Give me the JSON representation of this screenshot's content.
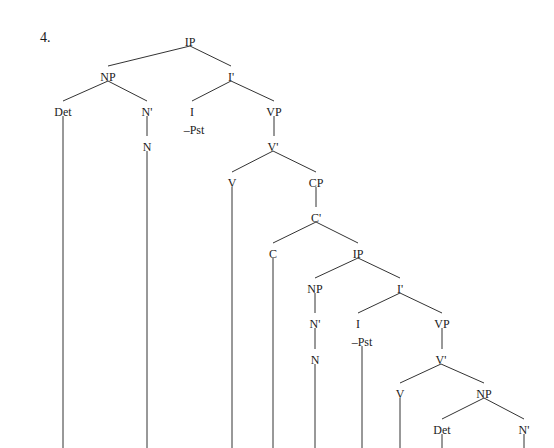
{
  "example_number": "4.",
  "tree": {
    "nodes": [
      {
        "id": "ip1",
        "label": "IP",
        "x": 190,
        "y": 42
      },
      {
        "id": "np1",
        "label": "NP",
        "x": 108,
        "y": 77
      },
      {
        "id": "ibar1",
        "label": "I'",
        "x": 231,
        "y": 77
      },
      {
        "id": "det1",
        "label": "Det",
        "x": 63,
        "y": 112
      },
      {
        "id": "nbar1",
        "label": "N'",
        "x": 147,
        "y": 112
      },
      {
        "id": "i1",
        "label": "I",
        "x": 192,
        "y": 112
      },
      {
        "id": "i1f",
        "label": "–Pst",
        "x": 194,
        "y": 130
      },
      {
        "id": "vp1",
        "label": "VP",
        "x": 274,
        "y": 112
      },
      {
        "id": "n1",
        "label": "N",
        "x": 147,
        "y": 147
      },
      {
        "id": "vbar1",
        "label": "V'",
        "x": 273,
        "y": 147
      },
      {
        "id": "v1",
        "label": "V",
        "x": 232,
        "y": 183
      },
      {
        "id": "cp1",
        "label": "CP",
        "x": 316,
        "y": 183
      },
      {
        "id": "cbar1",
        "label": "C'",
        "x": 316,
        "y": 218
      },
      {
        "id": "c1",
        "label": "C",
        "x": 273,
        "y": 254
      },
      {
        "id": "ip2",
        "label": "IP",
        "x": 358,
        "y": 254
      },
      {
        "id": "np2",
        "label": "NP",
        "x": 315,
        "y": 289
      },
      {
        "id": "ibar2",
        "label": "I'",
        "x": 400,
        "y": 289
      },
      {
        "id": "nbar2",
        "label": "N'",
        "x": 315,
        "y": 324
      },
      {
        "id": "i2",
        "label": "I",
        "x": 358,
        "y": 324
      },
      {
        "id": "i2f",
        "label": "–Pst",
        "x": 362,
        "y": 342
      },
      {
        "id": "vp2",
        "label": "VP",
        "x": 442,
        "y": 324
      },
      {
        "id": "n2",
        "label": "N",
        "x": 315,
        "y": 360
      },
      {
        "id": "vbar2",
        "label": "V'",
        "x": 441,
        "y": 360
      },
      {
        "id": "v2",
        "label": "V",
        "x": 400,
        "y": 394
      },
      {
        "id": "np3",
        "label": "NP",
        "x": 484,
        "y": 394
      },
      {
        "id": "det2",
        "label": "Det",
        "x": 442,
        "y": 430
      },
      {
        "id": "nbar3",
        "label": "N'",
        "x": 524,
        "y": 430
      }
    ],
    "edges": [
      [
        190,
        46,
        108,
        66
      ],
      [
        190,
        46,
        231,
        66
      ],
      [
        108,
        81,
        63,
        101
      ],
      [
        108,
        81,
        147,
        101
      ],
      [
        231,
        81,
        192,
        101
      ],
      [
        231,
        81,
        274,
        101
      ],
      [
        147,
        116,
        147,
        136
      ],
      [
        274,
        116,
        274,
        136
      ],
      [
        273,
        151,
        232,
        172
      ],
      [
        273,
        151,
        316,
        172
      ],
      [
        316,
        187,
        316,
        207
      ],
      [
        316,
        222,
        273,
        243
      ],
      [
        316,
        222,
        358,
        243
      ],
      [
        358,
        258,
        315,
        278
      ],
      [
        358,
        258,
        400,
        278
      ],
      [
        315,
        293,
        315,
        313
      ],
      [
        315,
        328,
        315,
        349
      ],
      [
        400,
        293,
        358,
        313
      ],
      [
        400,
        293,
        442,
        313
      ],
      [
        442,
        328,
        442,
        349
      ],
      [
        441,
        364,
        400,
        383
      ],
      [
        441,
        364,
        484,
        383
      ],
      [
        484,
        398,
        442,
        419
      ],
      [
        484,
        398,
        524,
        419
      ],
      [
        63,
        116,
        63,
        448
      ],
      [
        147,
        151,
        147,
        448
      ],
      [
        232,
        187,
        232,
        448
      ],
      [
        273,
        258,
        273,
        448
      ],
      [
        315,
        364,
        315,
        448
      ],
      [
        362,
        346,
        362,
        448
      ],
      [
        400,
        398,
        400,
        448
      ],
      [
        442,
        434,
        442,
        448
      ],
      [
        524,
        434,
        524,
        448
      ]
    ]
  }
}
